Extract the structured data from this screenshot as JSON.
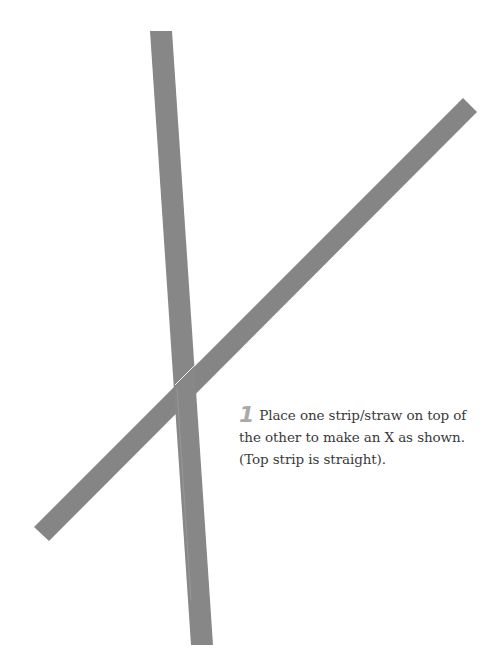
{
  "step": {
    "number": "1",
    "line1": "Place one strip/straw on top of",
    "line2": "the other to make an X as shown.",
    "line3": "(Top strip is straight)."
  },
  "illustration": {
    "strip_color": "#858585",
    "step_number_color": "#a9a9a9",
    "text_color": "#3a3a3a",
    "background": "#ffffff"
  }
}
